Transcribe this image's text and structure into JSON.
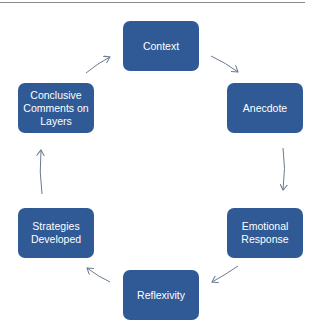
{
  "diagram": {
    "type": "cycle",
    "node_color": "#2f5a96",
    "text_color": "#ffffff",
    "arrow_color": "#6a7a90",
    "nodes": [
      {
        "id": "context",
        "label": "Context"
      },
      {
        "id": "anecdote",
        "label": "Anecdote"
      },
      {
        "id": "emotional-response",
        "label": "Emotional Response"
      },
      {
        "id": "reflexivity",
        "label": "Reflexivity"
      },
      {
        "id": "strategies-developed",
        "label": "Strategies Developed"
      },
      {
        "id": "conclusive-comments",
        "label": "Conclusive Comments on Layers"
      }
    ],
    "edges": [
      [
        "context",
        "anecdote"
      ],
      [
        "anecdote",
        "emotional-response"
      ],
      [
        "emotional-response",
        "reflexivity"
      ],
      [
        "reflexivity",
        "strategies-developed"
      ],
      [
        "strategies-developed",
        "conclusive-comments"
      ],
      [
        "conclusive-comments",
        "context"
      ]
    ]
  }
}
